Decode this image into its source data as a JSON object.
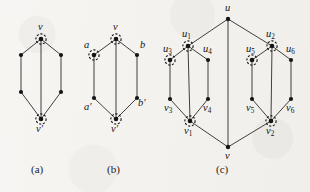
{
  "figure": {
    "kind": "graph-diagram",
    "background_color": "#f2f0ec",
    "ink_color": "#151515",
    "panels": [
      {
        "id": "a",
        "caption": "(a)",
        "vertex_labels": [
          "v",
          "v'"
        ],
        "marked_vertices": [
          "v",
          "v'"
        ],
        "vertex_count": 6,
        "edge_count": 7
      },
      {
        "id": "b",
        "caption": "(b)",
        "vertex_labels": [
          "v",
          "a",
          "b",
          "a'",
          "b'",
          "v'"
        ],
        "marked_vertices": [
          "v",
          "a",
          "v'"
        ],
        "vertex_count": 6,
        "edge_count": 7
      },
      {
        "id": "c",
        "caption": "(c)",
        "vertex_labels": [
          "u",
          "u1",
          "u2",
          "u3",
          "u4",
          "u5",
          "u6",
          "v1",
          "v2",
          "v3",
          "v4",
          "v5",
          "v6",
          "v"
        ],
        "marked_vertices": [
          "u1",
          "u2",
          "u3",
          "u5",
          "v1",
          "v2"
        ],
        "vertex_count": 14,
        "edge_count": 18
      }
    ],
    "labels": {
      "v": "v",
      "v_prime": "v′",
      "a": "a",
      "b": "b",
      "a_prime": "a′",
      "b_prime": "b′",
      "u": "u",
      "u_base": "u",
      "v_base": "v",
      "sub1": "1",
      "sub2": "2",
      "sub3": "3",
      "sub4": "4",
      "sub5": "5",
      "sub6": "6"
    },
    "captions": {
      "a": "(a)",
      "b": "(b)",
      "c": "(c)"
    }
  }
}
